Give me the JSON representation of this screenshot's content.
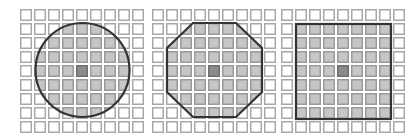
{
  "figure": {
    "grid": {
      "rows": 9,
      "cols": 9,
      "cell_size": 12,
      "pitch": 14,
      "top": 9
    },
    "colors": {
      "cell_fill": "#ffffff",
      "cell_border": "#a8a8a8",
      "shaded_fill": "#c6c6c6",
      "shaded_border": "#9a9a9a",
      "center_fill": "#8c8c8c",
      "center_border": "#6e6e6e",
      "outline": "#333333"
    },
    "panels": [
      {
        "name": "circle",
        "left": 20,
        "shape": "circle",
        "cx": 82.5,
        "cy": 70,
        "r": 47,
        "center_cell": [
          4,
          4
        ]
      },
      {
        "name": "octagon",
        "left": 152,
        "shape": "octagon",
        "points": [
          [
            193,
            23
          ],
          [
            236,
            23
          ],
          [
            262,
            48
          ],
          [
            262,
            92
          ],
          [
            236,
            117
          ],
          [
            193,
            117
          ],
          [
            167,
            92
          ],
          [
            167,
            48
          ]
        ],
        "center_cell": [
          4,
          4
        ]
      },
      {
        "name": "square",
        "left": 281,
        "shape": "square",
        "x": 296,
        "y": 24,
        "w": 95,
        "h": 95,
        "center_cell": [
          4,
          4
        ]
      }
    ]
  }
}
